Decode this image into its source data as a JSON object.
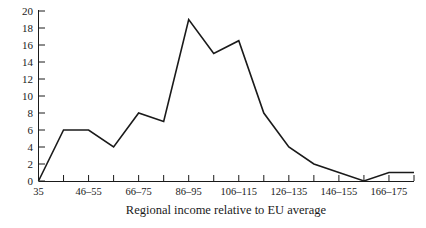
{
  "chart_data": {
    "type": "line",
    "title": "",
    "xlabel": "Regional income relative to EU average",
    "ylabel": "",
    "grid": false,
    "legend": false,
    "ylim": [
      0,
      20
    ],
    "y_ticks": [
      0,
      2,
      4,
      6,
      8,
      10,
      12,
      14,
      16,
      18,
      20
    ],
    "y_tick_labels": [
      "0",
      "2",
      "4",
      "6",
      "8",
      "10",
      "12",
      "14",
      "16",
      "18",
      "20"
    ],
    "x_tick_labels": [
      "35",
      "46–55",
      "66–75",
      "86–95",
      "106–115",
      "126–135",
      "146–155",
      "166–175"
    ],
    "x_tick_label_indices": [
      0,
      2,
      4,
      6,
      8,
      10,
      12,
      14
    ],
    "categories": [
      "35",
      "36–45",
      "46–55",
      "56–65",
      "66–75",
      "76–85",
      "86–95",
      "96–105",
      "106–115",
      "116–125",
      "126–135",
      "136–145",
      "146–155",
      "156–165",
      "166–175",
      "176–185"
    ],
    "values": [
      0,
      6,
      6,
      4,
      8,
      7,
      19,
      15,
      16.5,
      8,
      4,
      2,
      1,
      0,
      1,
      1
    ],
    "series": [
      {
        "name": "Frequency",
        "values": [
          0,
          6,
          6,
          4,
          8,
          7,
          19,
          15,
          16.5,
          8,
          4,
          2,
          1,
          0,
          1,
          1
        ]
      }
    ],
    "line_color": "#1a1a1a",
    "n_x_ticks": 16
  },
  "axis": {
    "x_title": "Regional income relative to EU average"
  }
}
